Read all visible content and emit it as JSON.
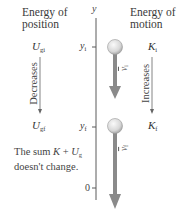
{
  "headings": {
    "left_line1": "Energy of",
    "left_line2": "position",
    "right_line1": "Energy of",
    "right_line2": "motion"
  },
  "axis": {
    "label": "y",
    "ticks": [
      {
        "label": "y",
        "sub": "i"
      },
      {
        "label": "y",
        "sub": "f"
      },
      {
        "label": "0",
        "sub": ""
      }
    ]
  },
  "potential": {
    "initial": {
      "symbol": "U",
      "sub": "gi"
    },
    "final": {
      "symbol": "U",
      "sub": "gf"
    },
    "trend": "Decreases"
  },
  "kinetic": {
    "initial": {
      "symbol": "K",
      "sub": "i"
    },
    "final": {
      "symbol": "K",
      "sub": "f"
    },
    "trend": "Increases"
  },
  "velocity": {
    "initial": {
      "symbol": "v",
      "sub": "i"
    },
    "final": {
      "symbol": "v",
      "sub": "f"
    }
  },
  "note": {
    "line1_prefix": "The sum ",
    "K": "K",
    "plus": " + ",
    "U": "U",
    "U_sub": "g",
    "line2": "doesn't change."
  },
  "colors": {
    "axis": "#555555",
    "arrow": "#8a8a8a",
    "ball_fill": "#e0e0e0",
    "ball_edge": "#9a9a9a",
    "text": "#333333"
  }
}
